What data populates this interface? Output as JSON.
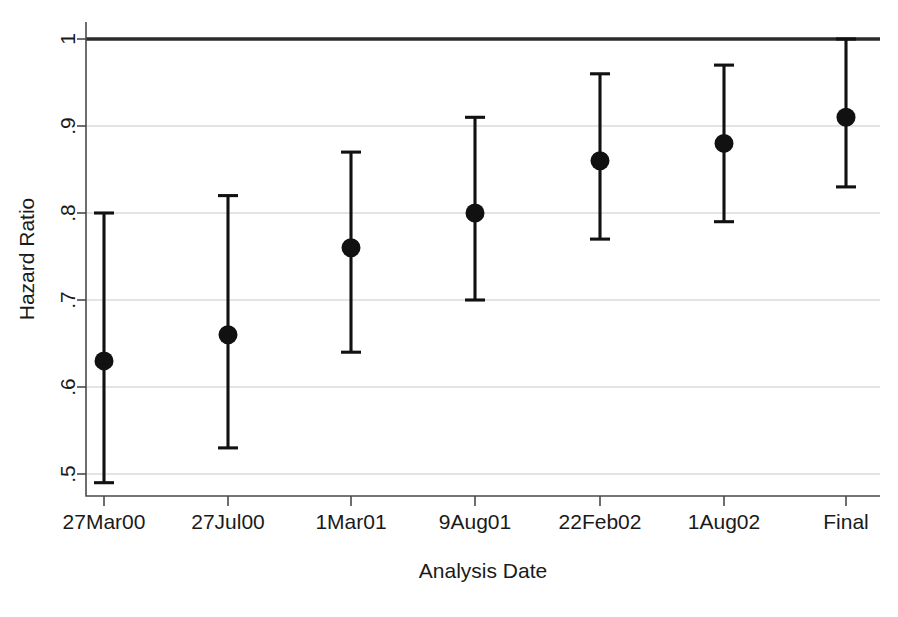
{
  "chart_data": {
    "type": "scatter",
    "title": "",
    "subtitle": "",
    "xlabel": "Analysis Date",
    "ylabel": "Hazard Ratio",
    "categories": [
      "27Mar00",
      "27Jul00",
      "1Mar01",
      "9Aug01",
      "22Feb02",
      "1Aug02",
      "Final"
    ],
    "xtick_labels": [
      "27Mar00",
      "27Jul00",
      "1Mar01",
      "9Aug01",
      "22Feb02",
      "1Aug02",
      "Final"
    ],
    "ytick_labels": [
      "1",
      ".9",
      ".8",
      ".7",
      ".6",
      ".5"
    ],
    "ytick_values": [
      1,
      0.9,
      0.8,
      0.7,
      0.6,
      0.5
    ],
    "ylim": [
      0.48,
      1.02
    ],
    "grid": "horizontal",
    "legend": "none",
    "reference_line": {
      "value": 1,
      "style": "solid-bold"
    },
    "series": [
      {
        "name": "Hazard Ratio",
        "values": [
          0.63,
          0.66,
          0.76,
          0.8,
          0.86,
          0.88,
          0.91
        ],
        "ci_low": [
          0.49,
          0.53,
          0.64,
          0.7,
          0.77,
          0.79,
          0.83
        ],
        "ci_high": [
          0.8,
          0.82,
          0.87,
          0.91,
          0.96,
          0.97,
          1.0
        ]
      }
    ],
    "points": [
      {
        "x": "27Mar00",
        "estimate": 0.63,
        "ci_low": 0.49,
        "ci_high": 0.8
      },
      {
        "x": "27Jul00",
        "estimate": 0.66,
        "ci_low": 0.53,
        "ci_high": 0.82
      },
      {
        "x": "1Mar01",
        "estimate": 0.76,
        "ci_low": 0.64,
        "ci_high": 0.87
      },
      {
        "x": "9Aug01",
        "estimate": 0.8,
        "ci_low": 0.7,
        "ci_high": 0.91
      },
      {
        "x": "22Feb02",
        "estimate": 0.86,
        "ci_low": 0.77,
        "ci_high": 0.96
      },
      {
        "x": "1Aug02",
        "estimate": 0.88,
        "ci_low": 0.79,
        "ci_high": 0.97
      },
      {
        "x": "Final",
        "estimate": 0.91,
        "ci_low": 0.83,
        "ci_high": 1.0
      }
    ],
    "colors": {
      "marker": "#111111",
      "error_bar": "#111111",
      "gridline": "#c9c9c9",
      "reference_line": "#2b2b2b",
      "axis": "#4a4a4a",
      "background": "#ffffff"
    }
  }
}
